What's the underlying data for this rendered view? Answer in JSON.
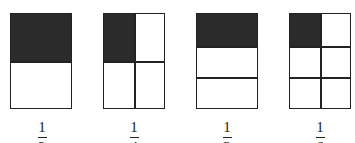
{
  "figures": [
    {
      "label_num": "1",
      "label_den": "2",
      "rows": 2,
      "cols": 1,
      "shaded": "top row"
    },
    {
      "label_num": "1",
      "label_den": "4",
      "rows": 2,
      "cols": 2,
      "shaded": "top-left cell"
    },
    {
      "label_num": "1",
      "label_den": "3",
      "rows": 3,
      "cols": 1,
      "shaded": "top row"
    },
    {
      "label_num": "1",
      "label_den": "6",
      "rows": 3,
      "cols": 2,
      "shaded": "top-left cell"
    }
  ],
  "colors": {
    "shade": "#2b2b2b",
    "line": "#222222",
    "background": "#ffffff"
  }
}
